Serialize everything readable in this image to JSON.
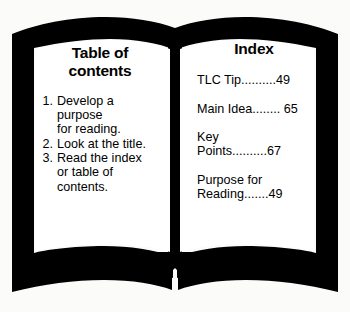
{
  "image": {
    "kind": "open-book-illustration",
    "background_color": "#fbfbfa",
    "ink_color": "#000000",
    "page_color": "#ffffff"
  },
  "left_page": {
    "title": "Table of\ncontents",
    "items": [
      {
        "number": "1.",
        "text": "Develop a\npurpose\nfor reading."
      },
      {
        "number": "2.",
        "text": "Look at the title."
      },
      {
        "number": "3.",
        "text": "Read the index\nor table of\ncontents."
      }
    ]
  },
  "right_page": {
    "title": "Index",
    "entries": [
      {
        "text": "TLC Tip..........49"
      },
      {
        "text": "Main Idea........ 65"
      },
      {
        "text": "Key\nPoints..........67"
      },
      {
        "text": "Purpose for\nReading.......49"
      }
    ]
  }
}
